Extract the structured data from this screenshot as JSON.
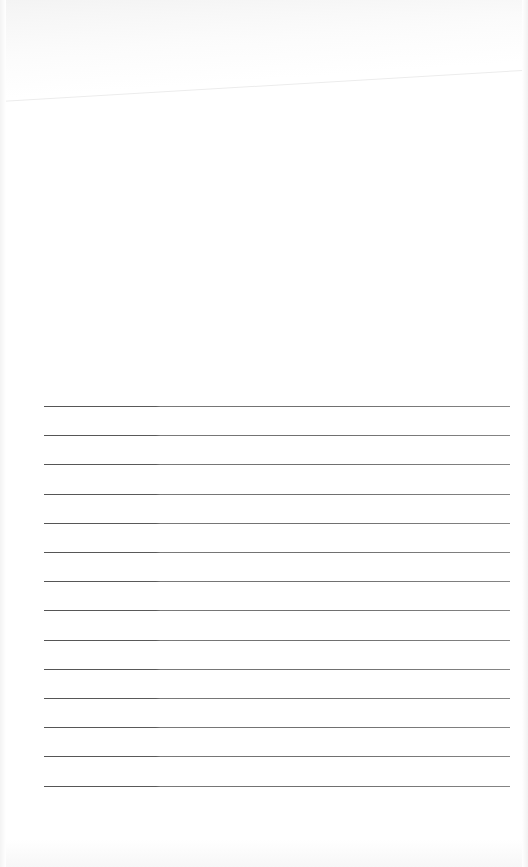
{
  "document": {
    "type": "blank lined page",
    "ruled_lines": {
      "count": 14,
      "left_px": 44,
      "right_px": 510,
      "first_top_px": 406,
      "spacing_px": 29.2
    },
    "colors": {
      "paper": "#ffffff",
      "rule": "#5a5a5a",
      "edge_shadow": "#f2f2f2"
    }
  }
}
